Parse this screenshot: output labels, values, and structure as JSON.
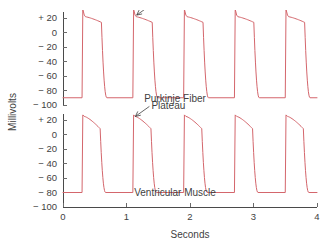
{
  "chart_data": {
    "type": "line",
    "title": "",
    "xlabel": "Seconds",
    "ylabel": "Millivolts",
    "xlim": [
      0,
      4
    ],
    "x_ticks": [
      0,
      1,
      2,
      3,
      4
    ],
    "x_tick_labels": [
      "0",
      "1",
      "2",
      "3",
      "4"
    ],
    "grid": false,
    "legend": "inline-labels",
    "stroke_color": "#d4666c",
    "axis_color": "#4a4a4a",
    "text_color": "#3f3f3f",
    "panels": [
      {
        "name": "purkinje-fiber",
        "label": "Purkinje Fiber",
        "ylim": [
          -110,
          32
        ],
        "y_ticks": [
          20,
          0,
          -20,
          -40,
          -60,
          -80,
          -100
        ],
        "y_tick_labels": [
          "+ 20",
          "0",
          "− 20",
          "− 40",
          "− 60",
          "− 80",
          "− 100"
        ],
        "resting_mv": -90,
        "peak_mv": 32,
        "notch_mv": 24,
        "plateau_start_mv": 22,
        "plateau_end_mv": 14,
        "period_s": 0.8,
        "upstroke_times_s": [
          0.3,
          1.1,
          1.9,
          2.7,
          3.5
        ],
        "plateau_duration_s": 0.27,
        "annotation": {
          "text": "Plateau",
          "points_to_s": 1.16,
          "points_to_mv": 24
        }
      },
      {
        "name": "ventricular-muscle",
        "label": "Ventricular Muscle",
        "ylim": [
          -110,
          32
        ],
        "y_ticks": [
          20,
          0,
          -20,
          -40,
          -60,
          -80,
          -100
        ],
        "y_tick_labels": [
          "+ 20",
          "0",
          "− 20",
          "− 40",
          "− 60",
          "− 80",
          "− 100"
        ],
        "resting_mv": -80,
        "peak_mv": 27,
        "notch_mv": 25,
        "plateau_start_mv": 25,
        "plateau_end_mv": 8,
        "period_s": 0.8,
        "upstroke_times_s": [
          0.3,
          1.1,
          1.9,
          2.7,
          3.5
        ],
        "plateau_duration_s": 0.25,
        "annotation": {
          "text": "Plateau",
          "points_to_s": 1.14,
          "points_to_mv": 25
        }
      }
    ]
  }
}
